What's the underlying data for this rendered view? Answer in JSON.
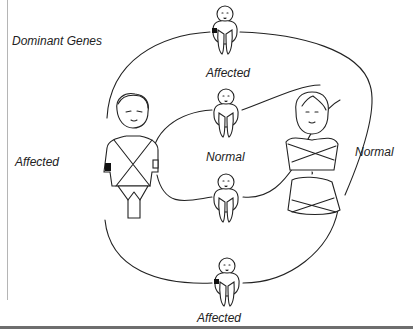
{
  "diagram": {
    "title": "Dominant Genes",
    "father": {
      "label": "Affected",
      "gene_marker": "dominant"
    },
    "mother": {
      "label": "Normal",
      "gene_marker": "none"
    },
    "children": [
      {
        "position": "top",
        "label": "Affected",
        "gene_marker": "dominant"
      },
      {
        "position": "middle-upper",
        "label": "Normal",
        "gene_marker": "none"
      },
      {
        "position": "middle-lower",
        "label": "",
        "gene_marker": "none"
      },
      {
        "position": "bottom",
        "label": "Affected",
        "gene_marker": "dominant"
      }
    ],
    "middle_label": "Normal",
    "colors": {
      "line": "#222222",
      "marker": "#111111",
      "background": "#ffffff"
    }
  }
}
